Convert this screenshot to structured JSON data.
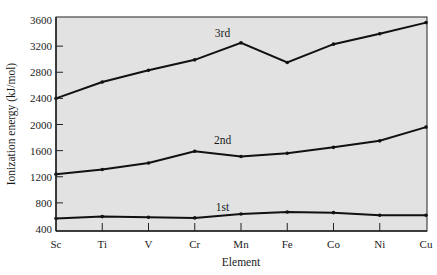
{
  "chart_data": {
    "type": "line",
    "title": "",
    "xlabel": "Element",
    "ylabel": "Ionization energy (kJ/mol)",
    "categories": [
      "Sc",
      "Ti",
      "V",
      "Cr",
      "Mn",
      "Fe",
      "Co",
      "Ni",
      "Cu"
    ],
    "ylim": [
      400,
      3600
    ],
    "yticks": [
      400,
      800,
      1200,
      1600,
      2000,
      2400,
      2800,
      3200,
      3600
    ],
    "grid": false,
    "legend": "inline labels",
    "series": [
      {
        "name": "1st",
        "values": [
          560,
          590,
          580,
          570,
          630,
          660,
          650,
          610,
          610
        ],
        "label_at": [
          3.6,
          680
        ]
      },
      {
        "name": "2nd",
        "values": [
          1240,
          1310,
          1410,
          1590,
          1510,
          1560,
          1650,
          1750,
          1960
        ],
        "label_at": [
          3.6,
          1700
        ]
      },
      {
        "name": "3rd",
        "values": [
          2400,
          2650,
          2830,
          2990,
          3250,
          2950,
          3230,
          3390,
          3560
        ],
        "label_at": [
          3.6,
          3340
        ]
      }
    ]
  },
  "colors": {
    "plot_background": "#e2e2e2",
    "line": "#111111",
    "axis": "#222222"
  }
}
